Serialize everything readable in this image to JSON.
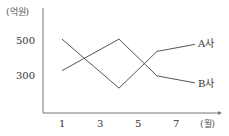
{
  "chart_data": {
    "type": "line",
    "title": "",
    "xlabel": "(월)",
    "ylabel": "(억원)",
    "x": [
      1,
      4,
      6,
      8
    ],
    "x_ticks": [
      "1",
      "3",
      "5",
      "7"
    ],
    "y_ticks": [
      "500",
      "300"
    ],
    "series": [
      {
        "name": "A사",
        "values": [
          505,
          225,
          435,
          475
        ]
      },
      {
        "name": "B사",
        "values": [
          325,
          505,
          295,
          255
        ]
      }
    ],
    "grid": false,
    "legend_position": "inline-right",
    "colors": {
      "line": "#555555",
      "axis": "#666666",
      "text": "#333333"
    }
  }
}
